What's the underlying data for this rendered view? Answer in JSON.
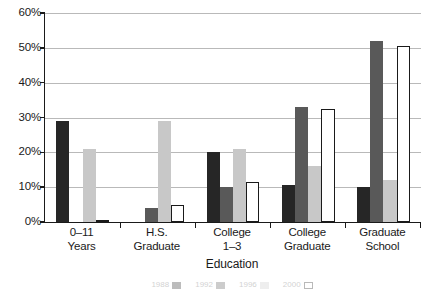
{
  "chart_data": {
    "type": "bar",
    "title": "",
    "subtitle": "",
    "xlabel": "Education",
    "ylabel": "",
    "categories": [
      "0–11 Years",
      "H.S. Graduate",
      "College 1–3",
      "College Graduate",
      "Graduate School"
    ],
    "category_lines": [
      [
        "0–11",
        "Years"
      ],
      [
        "H.S.",
        "Graduate"
      ],
      [
        "College",
        "1–3"
      ],
      [
        "College",
        "Graduate"
      ],
      [
        "Graduate",
        "School"
      ]
    ],
    "series": [
      {
        "name": "1988",
        "color": "#262626",
        "values": [
          29.0,
          0.0,
          20.0,
          10.5,
          10.0
        ]
      },
      {
        "name": "1992",
        "color": "#595959",
        "values": [
          0.0,
          4.0,
          10.0,
          33.0,
          52.0
        ]
      },
      {
        "name": "1996",
        "color": "#c8c8c8",
        "values": [
          21.0,
          29.0,
          21.0,
          16.0,
          12.0
        ]
      },
      {
        "name": "2000",
        "color": "#ffffff",
        "values": [
          0.5,
          5.0,
          11.5,
          32.5,
          50.5
        ]
      }
    ],
    "ylim": [
      0,
      60
    ],
    "yticks": [
      0,
      10,
      20,
      30,
      40,
      50,
      60
    ],
    "ytick_labels": [
      "0%",
      "10%",
      "20%",
      "30%",
      "40%",
      "50%",
      "60%"
    ],
    "grid": true,
    "grid_axis": "y",
    "legend_position": "bottom",
    "legend_visible": false,
    "legend_note": "legend row is cropped off the bottom edge of the screenshot and not legible"
  },
  "colors": {
    "series_1": "#262626",
    "series_2": "#595959",
    "series_3": "#c8c8c8",
    "series_4": "#ffffff",
    "gridline": "#b9b9b9",
    "axis": "#1a1a1a",
    "background": "#ffffff"
  }
}
